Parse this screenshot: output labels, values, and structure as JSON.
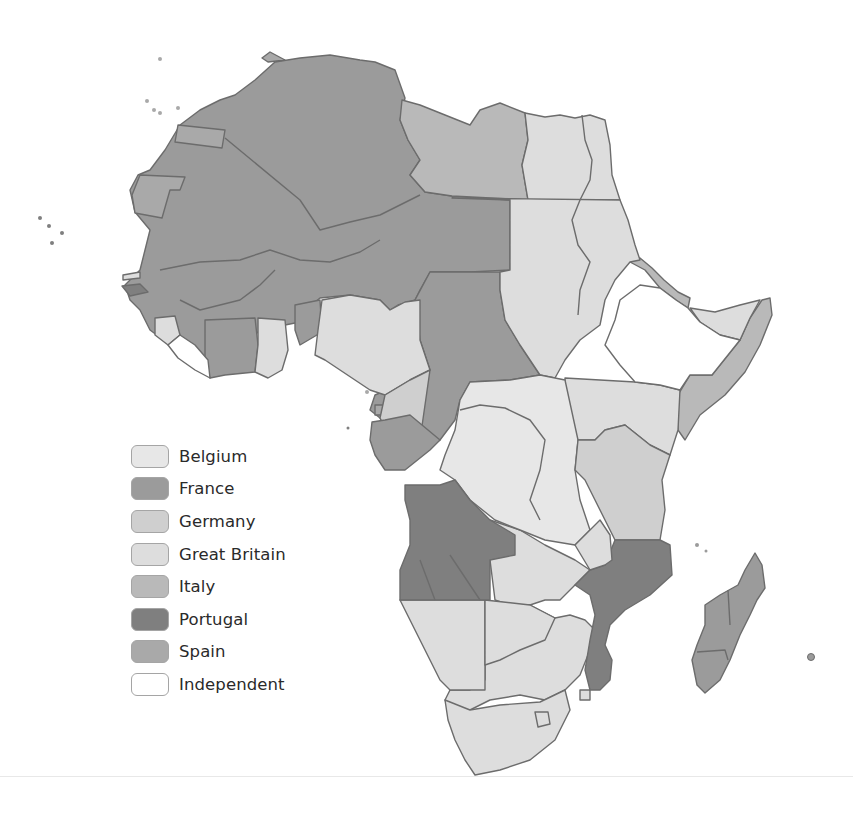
{
  "map": {
    "subject": "Colonial Africa",
    "colors": {
      "belgium": "#e7e7e7",
      "france": "#9b9b9b",
      "germany": "#cfcfcf",
      "great_britain": "#dddddd",
      "italy": "#b9b9b9",
      "portugal": "#7f7f7f",
      "spain": "#a9a9a9",
      "independent": "#ffffff",
      "border": "#6c6c6c"
    }
  },
  "legend": {
    "items": [
      {
        "label": "Belgium",
        "key": "belgium",
        "color": "#e7e7e7"
      },
      {
        "label": "France",
        "key": "france",
        "color": "#9b9b9b"
      },
      {
        "label": "Germany",
        "key": "germany",
        "color": "#cfcfcf"
      },
      {
        "label": "Great Britain",
        "key": "great_britain",
        "color": "#dddddd"
      },
      {
        "label": "Italy",
        "key": "italy",
        "color": "#b9b9b9"
      },
      {
        "label": "Portugal",
        "key": "portugal",
        "color": "#7f7f7f"
      },
      {
        "label": "Spain",
        "key": "spain",
        "color": "#a9a9a9"
      },
      {
        "label": "Independent",
        "key": "independent",
        "color": "#ffffff"
      }
    ]
  }
}
